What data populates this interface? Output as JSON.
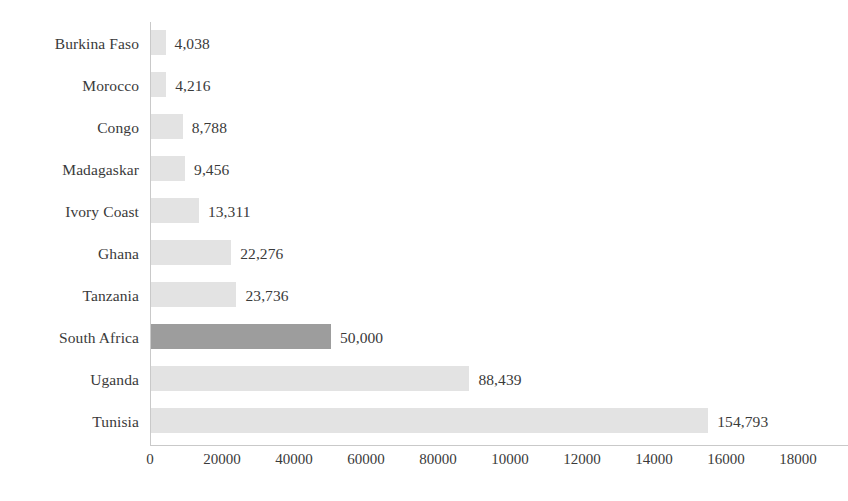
{
  "chart_data": {
    "type": "bar",
    "orientation": "horizontal",
    "title": "",
    "subtitle": "",
    "xlabel": "",
    "ylabel": "",
    "xlim": [
      0,
      180000
    ],
    "ylim": null,
    "grid": false,
    "legend": null,
    "categories": [
      "Burkina Faso",
      "Morocco",
      "Congo",
      "Madagaskar",
      "Ivory Coast",
      "Ghana",
      "Tanzania",
      "South Africa",
      "Uganda",
      "Tunisia"
    ],
    "values": [
      4038,
      4216,
      8788,
      9456,
      13311,
      22276,
      23736,
      50000,
      88439,
      154793
    ],
    "value_labels": [
      "4,038",
      "4,216",
      "8,788",
      "9,456",
      "13,311",
      "22,276",
      "23,736",
      "50,000",
      "88,439",
      "154,793"
    ],
    "highlight_index": 7,
    "xtick_values": [
      0,
      20000,
      40000,
      60000,
      80000,
      100000,
      120000,
      140000,
      160000,
      180000
    ],
    "xtick_labels": [
      "0",
      "20000",
      "40000",
      "60000",
      "80000",
      "10000",
      "12000",
      "14000",
      "16000",
      "18000"
    ],
    "colors": {
      "bar": "#e3e3e3",
      "bar_highlight": "#9d9d9d",
      "axis": "#c9c9c9",
      "text": "#3a3a3a",
      "background": "#ffffff"
    }
  }
}
